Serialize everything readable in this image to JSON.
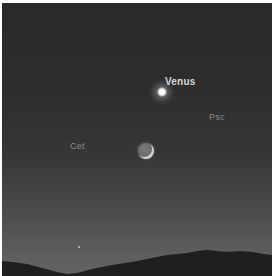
{
  "scene": {
    "description": "Twilight sky over mountain silhouette with Venus and crescent Moon",
    "labels": {
      "venus": "Venus",
      "psc": "Psc",
      "cet": "Cet"
    },
    "colors": {
      "sky_top": "#2a2a2a",
      "sky_horizon": "#636363",
      "mountains": "#1e1e1e",
      "venus_label": "#d8d8d8",
      "constellation_label": "#8e8e8e"
    }
  }
}
